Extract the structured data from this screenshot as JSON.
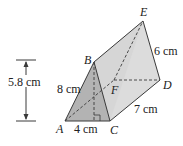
{
  "figure": {
    "type": "triangular-prism",
    "vertices": {
      "A": "A",
      "B": "B",
      "C": "C",
      "D": "D",
      "E": "E",
      "F": "F"
    },
    "measurements": {
      "height": "5.8 cm",
      "AB": "8 cm",
      "AC": "4 cm",
      "CD": "7 cm",
      "DE": "6 cm"
    },
    "colors": {
      "front_face": "#b3b3b3",
      "side_face": "#dcdcdc",
      "top_face": "#d4d4d4",
      "edge": "#3a3a3a"
    }
  }
}
